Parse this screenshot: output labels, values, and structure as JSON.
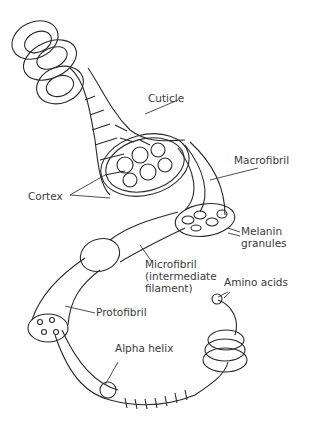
{
  "diagram": {
    "labels": {
      "cuticle": "Cuticle",
      "macrofibril": "Macrofibril",
      "cortex": "Cortex",
      "melanin_granules": "Melanin\ngranules",
      "microfibril": "Microfibril\n(intermediate\nfilament)",
      "amino_acids": "Amino acids",
      "protofibril": "Protofibril",
      "alpha_helix": "Alpha helix"
    },
    "colors": {
      "line": "#2a2a2a",
      "text": "#3a3a3a",
      "background": "#ffffff"
    }
  }
}
